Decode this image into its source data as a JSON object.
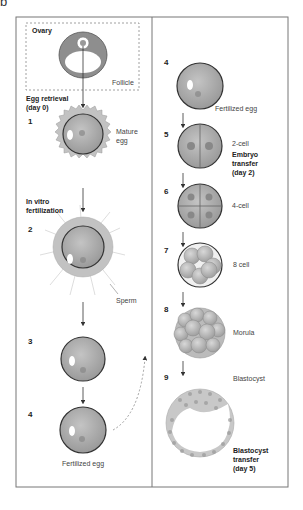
{
  "figure_letter": "b",
  "left_panel": {
    "ovary_label": "Ovary",
    "follicle_label": "Follicle",
    "egg_retrieval": "Egg retrieval",
    "egg_retrieval_day": "(day 0)",
    "in_vitro": "In vitro",
    "fertilization": "fertilization",
    "steps": [
      {
        "num": "1",
        "label_line1": "Mature",
        "label_line2": "egg"
      },
      {
        "num": "2",
        "label": "Sperm"
      },
      {
        "num": "3"
      },
      {
        "num": "4",
        "label": "Fertilized egg"
      }
    ]
  },
  "right_panel": {
    "steps": [
      {
        "num": "4",
        "label": "Fertilized egg"
      },
      {
        "num": "5",
        "label": "2-cell"
      },
      {
        "num": "6",
        "label": "4-cell"
      },
      {
        "num": "7",
        "label": "8 cell"
      },
      {
        "num": "8",
        "label": "Morula"
      },
      {
        "num": "9",
        "label": "Blastocyst"
      }
    ],
    "embryo_transfer": [
      "Embryo",
      "transfer",
      "(day 2)"
    ],
    "blastocyst_transfer": [
      "Blastocyst",
      "transfer",
      "(day 5)"
    ]
  },
  "colors": {
    "cell_fill": "#a9a9a9",
    "cell_stroke": "#444444",
    "frame": "#777777",
    "cumulus": "#bdbdbd"
  }
}
